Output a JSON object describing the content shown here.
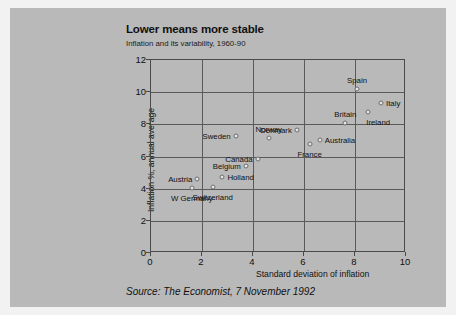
{
  "card": {
    "background_color": "#b9b9b9",
    "page_background_color": "#f2f2f2"
  },
  "source": {
    "text": "Source: The Economist, 7 November 1992"
  },
  "chart_data": {
    "type": "scatter",
    "title": "Lower means more stable",
    "subtitle": "Inflation and its variability, 1960-90",
    "xlabel": "Standard deviation of inflation",
    "ylabel": "Inflation %, annual average",
    "xlim": [
      0,
      10
    ],
    "ylim": [
      0,
      12
    ],
    "xticks": [
      0,
      2,
      4,
      6,
      8,
      10
    ],
    "yticks": [
      0,
      2,
      4,
      6,
      8,
      10,
      12
    ],
    "grid": true,
    "legend": "none",
    "marker_color": "#e6e6e6",
    "marker_edge_color": "#6d6d6d",
    "points": [
      {
        "label": "W Germany",
        "x": 1.6,
        "y": 4.05,
        "label_pos": "below-center"
      },
      {
        "label": "Austria",
        "x": 1.82,
        "y": 4.57,
        "label_pos": "left"
      },
      {
        "label": "Switzerland",
        "x": 2.42,
        "y": 4.08,
        "label_pos": "below-center"
      },
      {
        "label": "Holland",
        "x": 2.8,
        "y": 4.72,
        "label_pos": "right"
      },
      {
        "label": "Sweden",
        "x": 3.32,
        "y": 7.28,
        "label_pos": "left"
      },
      {
        "label": "Belgium",
        "x": 3.72,
        "y": 5.42,
        "label_pos": "left"
      },
      {
        "label": "Canada",
        "x": 4.18,
        "y": 5.85,
        "label_pos": "left"
      },
      {
        "label": "Norway",
        "x": 4.62,
        "y": 7.18,
        "label_pos": "above-center"
      },
      {
        "label": "Denmark",
        "x": 5.72,
        "y": 7.62,
        "label_pos": "left"
      },
      {
        "label": "France",
        "x": 6.22,
        "y": 6.78,
        "label_pos": "below-center"
      },
      {
        "label": "Australia",
        "x": 6.62,
        "y": 7.02,
        "label_pos": "right"
      },
      {
        "label": "Britain",
        "x": 7.62,
        "y": 8.08,
        "label_pos": "above-center"
      },
      {
        "label": "Spain",
        "x": 8.08,
        "y": 10.22,
        "label_pos": "above-center"
      },
      {
        "label": "Ireland",
        "x": 8.52,
        "y": 8.78,
        "label_pos": "below-right"
      },
      {
        "label": "Italy",
        "x": 9.02,
        "y": 9.35,
        "label_pos": "right"
      }
    ]
  }
}
